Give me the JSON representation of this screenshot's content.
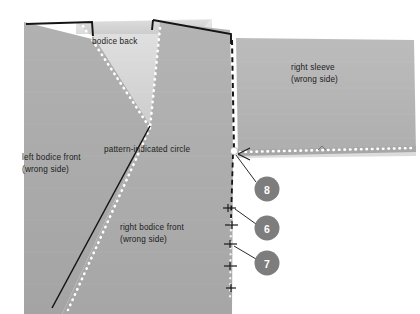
{
  "figure": {
    "background_color": "#ffffff"
  },
  "colors": {
    "fabric_front": "#a8a8a8",
    "fabric_front_shade": "#b0b0b0",
    "fabric_back": "#d2d2d2",
    "sleeve": "#b4b4b4",
    "stitch_dots": "#ffffff",
    "seam_line": "#1a1a1a",
    "callout_fill": "#7d7d7d",
    "callout_text": "#ffffff",
    "circle_marker": "#ffffff"
  },
  "labels": {
    "bodice_back": "bodice back",
    "left_bodice_front": "left bodice front",
    "left_bodice_front_sub": "(wrong side)",
    "right_bodice_front": "right bodice front",
    "right_bodice_front_sub": "(wrong side)",
    "right_sleeve": "right sleeve",
    "right_sleeve_sub": "(wrong side)",
    "pattern_circle": "pattern-indicated circle"
  },
  "callouts": [
    {
      "id": "callout-8",
      "number": "8",
      "cx": 267,
      "cy": 189,
      "r": 12.5
    },
    {
      "id": "callout-6",
      "number": "6",
      "cx": 267,
      "cy": 228,
      "r": 12.5
    },
    {
      "id": "callout-7",
      "number": "7",
      "cx": 267,
      "cy": 263,
      "r": 12.5
    }
  ],
  "markers": {
    "pattern_indicated_circle": {
      "cx": 234,
      "cy": 151,
      "r": 3.6
    }
  },
  "pieces": [
    {
      "name": "left-bodice-front",
      "side": "wrong side"
    },
    {
      "name": "right-bodice-front",
      "side": "wrong side"
    },
    {
      "name": "bodice-back",
      "side": ""
    },
    {
      "name": "right-sleeve",
      "side": "wrong side"
    }
  ]
}
